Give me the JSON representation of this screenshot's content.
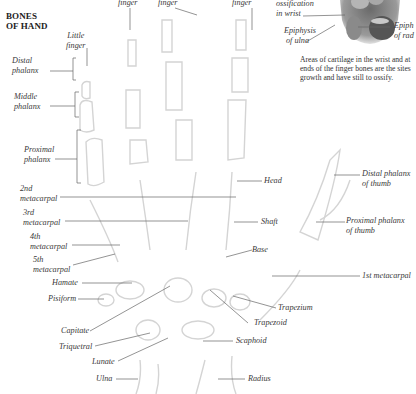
{
  "title": {
    "line1": "BONES",
    "line2": "OF HAND"
  },
  "top_labels": {
    "ring_finger": "finger",
    "middle_finger": "finger",
    "index_finger": "finger"
  },
  "inset": {
    "ossification_line1": "ossification",
    "ossification_line2": "in wrist",
    "epiphysis_ulna_line1": "Epiphysis",
    "epiphysis_ulna_line2": "of ulna",
    "epiphysis_radius_line1": "Epiph",
    "epiphysis_radius_line2": "of rad",
    "note_line1": "Areas of cartilage in the wrist and at",
    "note_line2": "ends of the finger bones are the sites",
    "note_line3": "growth and have still to ossify."
  },
  "left_labels": {
    "little_finger_line1": "Little",
    "little_finger_line2": "finger",
    "distal_line1": "Distal",
    "distal_line2": "phalanx",
    "middle_line1": "Middle",
    "middle_line2": "phalanx",
    "proximal_line1": "Proximal",
    "proximal_line2": "phalanx",
    "mc2_line1": "2nd",
    "mc2_line2": "metacarpal",
    "mc3_line1": "3rd",
    "mc3_line2": "metacarpal",
    "mc4_line1": "4th",
    "mc4_line2": "metacarpal",
    "mc5_line1": "5th",
    "mc5_line2": "metacarpal",
    "hamate": "Hamate",
    "pisiform": "Pisiform",
    "capitate": "Capitate",
    "triquetral": "Triquetral",
    "lunate": "Lunate",
    "ulna": "Ulna"
  },
  "right_labels": {
    "head": "Head",
    "shaft": "Shaft",
    "base": "Base",
    "distal_thumb_line1": "Distal phalanx",
    "distal_thumb_line2": "of thumb",
    "proximal_thumb_line1": "Proximal phalanx",
    "proximal_thumb_line2": "of thumb",
    "mc1": "1st metacarpal",
    "trapezium": "Trapezium",
    "trapezoid": "Trapezoid",
    "scaphoid": "Scaphoid",
    "radius": "Radius"
  },
  "colors": {
    "leader": "#555555",
    "bone": "#d8d8d8",
    "text": "#333333"
  }
}
